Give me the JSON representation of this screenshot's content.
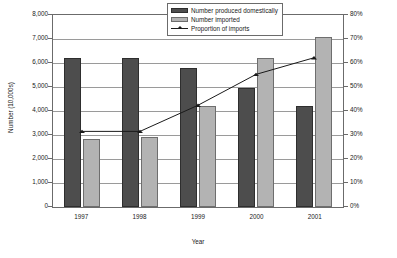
{
  "chart_data": {
    "type": "bar",
    "title": "",
    "subtitle": "",
    "xlabel": "Year",
    "ylabel": "Number (10,000s)",
    "y2label": "",
    "categories": [
      "1997",
      "1998",
      "1999",
      "2000",
      "2001"
    ],
    "series": [
      {
        "name": "Number produced domestically",
        "type": "bar",
        "axis": "left",
        "color": "#4d4d4d",
        "values": [
          6200,
          6200,
          5800,
          4950,
          4200
        ]
      },
      {
        "name": "Number imported",
        "type": "bar",
        "axis": "left",
        "color": "#b3b3b3",
        "values": [
          2850,
          2900,
          4200,
          6200,
          7100
        ]
      },
      {
        "name": "Proportion of imports",
        "type": "line",
        "axis": "right",
        "color": "#1a1a1a",
        "values": [
          31,
          31,
          42,
          55,
          62
        ]
      }
    ],
    "ylim": [
      0,
      8000
    ],
    "yticks": [
      "0",
      "1,000",
      "2,000",
      "3,000",
      "4,000",
      "5,000",
      "6,000",
      "7,000",
      "8,000"
    ],
    "y2lim": [
      0,
      80
    ],
    "y2ticks": [
      "0%",
      "10%",
      "20%",
      "30%",
      "40%",
      "50%",
      "60%",
      "70%",
      "80%"
    ],
    "grid": true,
    "legend_position": "top-right-inside"
  },
  "legend": {
    "items": [
      {
        "label": "Number produced domestically",
        "swatch": "dark-bar-swatch"
      },
      {
        "label": "Number imported",
        "swatch": "light-bar-swatch"
      },
      {
        "label": "Proportion of imports",
        "swatch": "line-marker-swatch"
      }
    ]
  }
}
